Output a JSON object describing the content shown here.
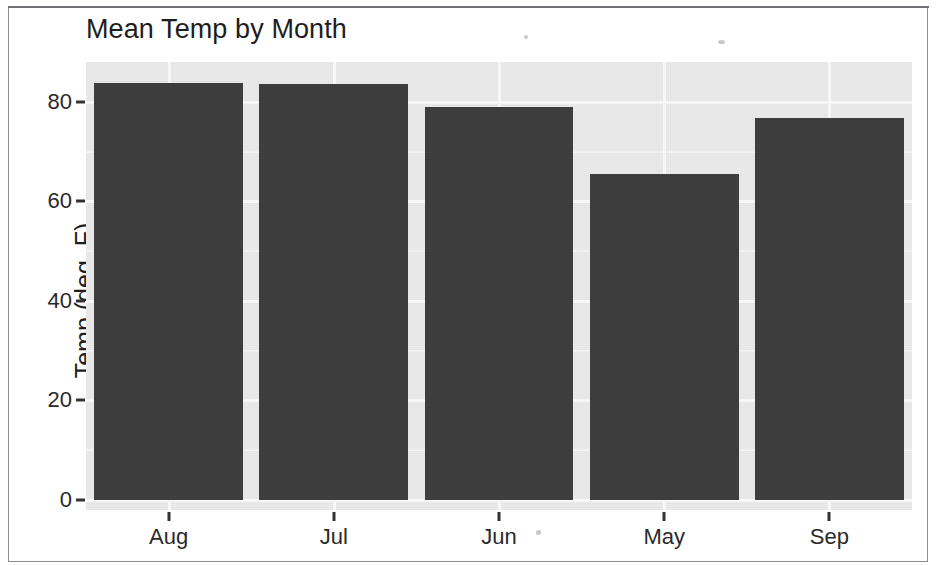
{
  "chart_data": {
    "type": "bar",
    "title": "Mean Temp by Month",
    "xlabel": "",
    "ylabel": "Temp (deg. F)",
    "categories": [
      "Aug",
      "Jul",
      "Jun",
      "May",
      "Sep"
    ],
    "values": [
      83.7,
      83.6,
      79.0,
      65.5,
      76.8
    ],
    "ylim": [
      0,
      88
    ],
    "y_ticks": [
      0,
      20,
      40,
      60,
      80
    ],
    "y_tick_labels": [
      "0",
      "20",
      "40",
      "60",
      "80"
    ],
    "grid": true,
    "legend": "none",
    "bar_color": "#3c3c3c",
    "panel_color": "#ebebeb",
    "gridline_color": "#fafafa",
    "series": [
      {
        "name": "Mean Temp",
        "values": [
          83.7,
          83.6,
          79.0,
          65.5,
          76.8
        ]
      }
    ],
    "points": [
      {
        "category": "Aug",
        "value": 83.7
      },
      {
        "category": "Jul",
        "value": 83.6
      },
      {
        "category": "Jun",
        "value": 79.0
      },
      {
        "category": "May",
        "value": 65.5
      },
      {
        "category": "Sep",
        "value": 76.8
      }
    ]
  }
}
